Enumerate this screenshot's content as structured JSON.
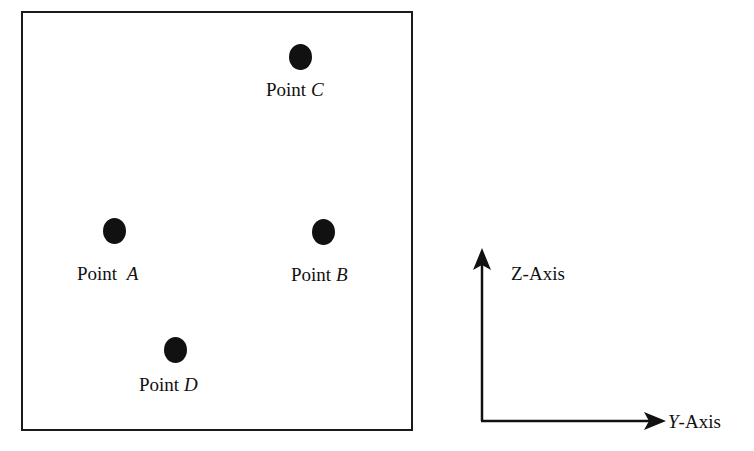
{
  "diagram": {
    "points": [
      {
        "id": "A",
        "prefix": "Point",
        "letter": "A"
      },
      {
        "id": "B",
        "prefix": "Point",
        "letter": "B"
      },
      {
        "id": "C",
        "prefix": "Point",
        "letter": "C"
      },
      {
        "id": "D",
        "prefix": "Point",
        "letter": "D"
      }
    ],
    "axes": {
      "z_label": "Z-Axis",
      "y_letter": "Y",
      "y_suffix": "-Axis"
    }
  }
}
